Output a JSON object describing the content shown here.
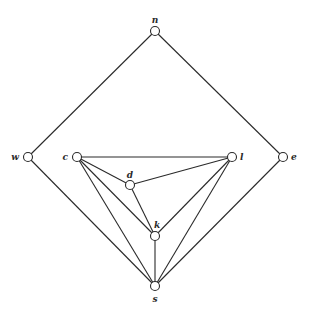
{
  "diagram": {
    "type": "graph",
    "node_radius": 4.5,
    "nodes": [
      {
        "id": "n",
        "label": "n",
        "x": 155,
        "y": 31,
        "lx": 155,
        "ly": 23,
        "anchor": "middle"
      },
      {
        "id": "w",
        "label": "w",
        "x": 28,
        "y": 157,
        "lx": 19,
        "ly": 160,
        "anchor": "end"
      },
      {
        "id": "c",
        "label": "c",
        "x": 77,
        "y": 157,
        "lx": 68,
        "ly": 160,
        "anchor": "end"
      },
      {
        "id": "d",
        "label": "d",
        "x": 130,
        "y": 185,
        "lx": 130,
        "ly": 178,
        "anchor": "middle"
      },
      {
        "id": "l",
        "label": "l",
        "x": 232,
        "y": 157,
        "lx": 240,
        "ly": 160,
        "anchor": "start"
      },
      {
        "id": "e",
        "label": "e",
        "x": 283,
        "y": 157,
        "lx": 291,
        "ly": 160,
        "anchor": "start"
      },
      {
        "id": "k",
        "label": "k",
        "x": 155,
        "y": 236,
        "lx": 157,
        "ly": 228,
        "anchor": "middle"
      },
      {
        "id": "s",
        "label": "s",
        "x": 155,
        "y": 286,
        "lx": 155,
        "ly": 302,
        "anchor": "middle"
      }
    ],
    "edges": [
      [
        "n",
        "w"
      ],
      [
        "n",
        "e"
      ],
      [
        "w",
        "s"
      ],
      [
        "e",
        "s"
      ],
      [
        "c",
        "l"
      ],
      [
        "c",
        "d"
      ],
      [
        "c",
        "k"
      ],
      [
        "c",
        "s"
      ],
      [
        "d",
        "l"
      ],
      [
        "d",
        "k"
      ],
      [
        "l",
        "k"
      ],
      [
        "l",
        "s"
      ],
      [
        "k",
        "s"
      ]
    ]
  }
}
